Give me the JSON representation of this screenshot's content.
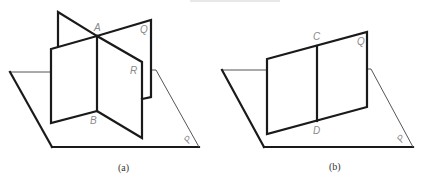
{
  "figure": {
    "panels": [
      {
        "id": "a",
        "caption": "(a)",
        "plane_label": "P",
        "labels": {
          "top_point": "A",
          "bottom_point": "B",
          "plane_Q": "Q",
          "plane_R": "R"
        }
      },
      {
        "id": "b",
        "caption": "(b)",
        "plane_label": "P",
        "labels": {
          "top_point": "C",
          "bottom_point": "D",
          "plane_Q": "Q"
        }
      }
    ],
    "colors": {
      "line": "#1a1a1a",
      "thin_line": "#555555",
      "label": "#8a8a8a"
    }
  }
}
